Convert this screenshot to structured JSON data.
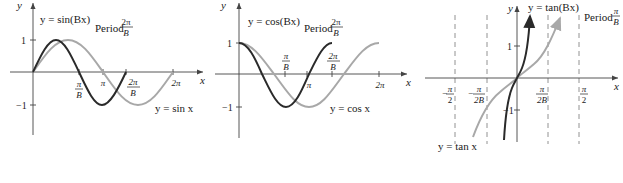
{
  "colors": {
    "dark_curve": "#2a2a2a",
    "light_curve": "#a8a8a8",
    "axis": "#444444",
    "asymptote": "#777777",
    "text": "#222222"
  },
  "panels": [
    {
      "name": "sine",
      "curve_label": "y = sin(Bx)",
      "base_label": "y = sin x",
      "period_label": "Period",
      "period_num": "2π",
      "period_den": "B",
      "axis_x": "x",
      "axis_y": "y",
      "ticks_y": [
        "1",
        "−1"
      ],
      "ticks_x": [
        {
          "num": "π",
          "den": "B"
        },
        {
          "num": "π",
          "den": ""
        },
        {
          "num": "2π",
          "den": "B"
        },
        {
          "num": "2π",
          "den": ""
        }
      ]
    },
    {
      "name": "cosine",
      "curve_label": "y = cos(Bx)",
      "base_label": "y = cos x",
      "period_label": "Period",
      "period_num": "2π",
      "period_den": "B",
      "axis_x": "x",
      "axis_y": "y",
      "ticks_y": [
        "1",
        "−1"
      ],
      "ticks_x": [
        {
          "num": "π",
          "den": "B"
        },
        {
          "num": "π",
          "den": ""
        },
        {
          "num": "2π",
          "den": "B"
        },
        {
          "num": "2π",
          "den": ""
        }
      ]
    },
    {
      "name": "tangent",
      "curve_label": "y = tan(Bx)",
      "base_label": "y = tan x",
      "period_label": "Period",
      "period_num": "π",
      "period_den": "B",
      "axis_x": "x",
      "axis_y": "y",
      "ticks_y": [
        "1",
        "−1"
      ],
      "ticks_x": [
        {
          "num": "π",
          "den": "2",
          "sign": "−"
        },
        {
          "num": "π",
          "den": "2B",
          "sign": "−"
        },
        {
          "num": "π",
          "den": "2B",
          "sign": ""
        },
        {
          "num": "π",
          "den": "2",
          "sign": ""
        }
      ]
    }
  ]
}
